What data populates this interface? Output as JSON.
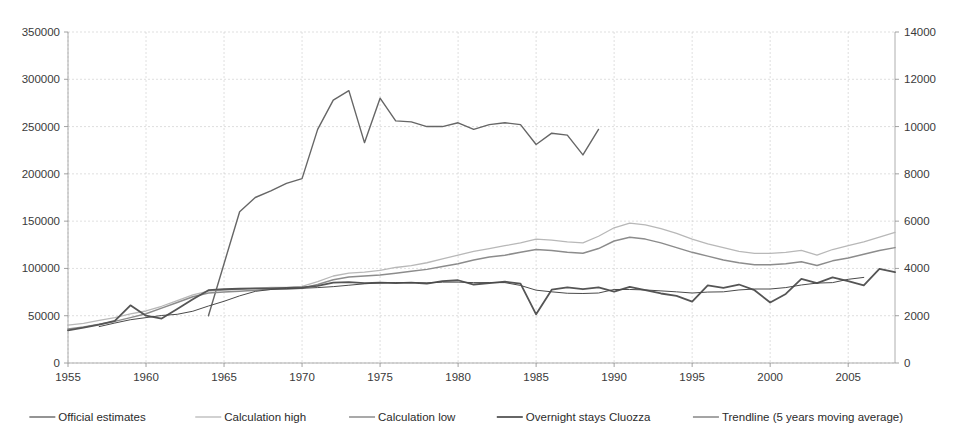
{
  "chart_data": {
    "type": "line",
    "title": "",
    "subtitle": "",
    "xlabel": "",
    "ylabel": "",
    "y2label": "",
    "grid": true,
    "legend_position": "bottom",
    "xlim": [
      1955,
      2008
    ],
    "xticks": [
      1955,
      1960,
      1965,
      1970,
      1975,
      1980,
      1985,
      1990,
      1995,
      2000,
      2005
    ],
    "xtick_labels": [
      "1955",
      "1960",
      "1965",
      "1970",
      "1975",
      "1980",
      "1985",
      "1990",
      "1995",
      "2000",
      "2005"
    ],
    "ylim": [
      0,
      350000
    ],
    "yticks": [
      0,
      50000,
      100000,
      150000,
      200000,
      250000,
      300000,
      350000
    ],
    "ytick_labels": [
      "0",
      "50000",
      "100000",
      "150000",
      "200000",
      "250000",
      "300000",
      "350000"
    ],
    "y2lim": [
      0,
      14000
    ],
    "y2ticks": [
      0,
      2000,
      4000,
      6000,
      8000,
      10000,
      12000,
      14000
    ],
    "y2tick_labels": [
      "0",
      "2000",
      "4000",
      "6000",
      "8000",
      "10000",
      "12000",
      "14000"
    ],
    "series": [
      {
        "name": "Official estimates",
        "axis": "left",
        "color": "#666666",
        "width": 1.4,
        "x": [
          1964,
          1965,
          1966,
          1967,
          1968,
          1969,
          1970,
          1971,
          1972,
          1973,
          1974,
          1975,
          1976,
          1977,
          1978,
          1979,
          1980,
          1981,
          1982,
          1983,
          1984,
          1985,
          1986,
          1987,
          1988,
          1989
        ],
        "values": [
          50000,
          105000,
          160000,
          175000,
          182000,
          190000,
          195000,
          247000,
          278000,
          288000,
          233000,
          280000,
          256000,
          255000,
          250000,
          250000,
          254000,
          247000,
          252000,
          254000,
          252000,
          231000,
          243000,
          241000,
          220000,
          247000
        ]
      },
      {
        "name": "Calculation high",
        "axis": "left",
        "color": "#b8b8b8",
        "width": 1.3,
        "x": [
          1955,
          1956,
          1957,
          1958,
          1959,
          1960,
          1961,
          1962,
          1963,
          1964,
          1965,
          1966,
          1967,
          1968,
          1969,
          1970,
          1971,
          1972,
          1973,
          1974,
          1975,
          1976,
          1977,
          1978,
          1979,
          1980,
          1981,
          1982,
          1983,
          1984,
          1985,
          1986,
          1987,
          1988,
          1989,
          1990,
          1991,
          1992,
          1993,
          1994,
          1995,
          1996,
          1997,
          1998,
          1999,
          2000,
          2001,
          2002,
          2003,
          2004,
          2005,
          2006,
          2007,
          2008
        ],
        "values": [
          40000,
          42000,
          45000,
          48000,
          52000,
          55000,
          60000,
          66000,
          72000,
          76000,
          77000,
          78000,
          79000,
          80000,
          80000,
          81000,
          86000,
          92000,
          95000,
          96000,
          98000,
          101000,
          103000,
          106000,
          110000,
          114000,
          118000,
          121000,
          124000,
          127000,
          131000,
          130000,
          128000,
          127000,
          134000,
          143000,
          148000,
          146000,
          142000,
          137000,
          131000,
          126000,
          122000,
          118000,
          116000,
          116000,
          117000,
          119000,
          114000,
          120000,
          124000,
          128000,
          133000,
          138000
        ]
      },
      {
        "name": "Calculation low",
        "axis": "left",
        "color": "#8c8c8c",
        "width": 1.5,
        "x": [
          1955,
          1956,
          1957,
          1958,
          1959,
          1960,
          1961,
          1962,
          1963,
          1964,
          1965,
          1966,
          1967,
          1968,
          1969,
          1970,
          1971,
          1972,
          1973,
          1974,
          1975,
          1976,
          1977,
          1978,
          1979,
          1980,
          1981,
          1982,
          1983,
          1984,
          1985,
          1986,
          1987,
          1988,
          1989,
          1990,
          1991,
          1992,
          1993,
          1994,
          1995,
          1996,
          1997,
          1998,
          1999,
          2000,
          2001,
          2002,
          2003,
          2004,
          2005,
          2006,
          2007,
          2008
        ],
        "values": [
          36000,
          38000,
          41000,
          44000,
          48000,
          52000,
          58000,
          64000,
          70000,
          74000,
          75000,
          76000,
          77000,
          78000,
          78000,
          79000,
          83000,
          88000,
          91000,
          92000,
          93000,
          95000,
          97000,
          99000,
          102000,
          105000,
          109000,
          112000,
          114000,
          117000,
          120000,
          119000,
          117000,
          116000,
          121000,
          129000,
          133000,
          131000,
          127000,
          122000,
          117000,
          113000,
          109000,
          106000,
          104000,
          104000,
          105000,
          107000,
          103000,
          108000,
          111000,
          115000,
          119000,
          122000
        ]
      },
      {
        "name": "Overnight stays Cluozza",
        "axis": "right",
        "color": "#555555",
        "width": 1.8,
        "x": [
          1955,
          1956,
          1957,
          1958,
          1959,
          1960,
          1961,
          1962,
          1963,
          1964,
          1965,
          1966,
          1967,
          1968,
          1969,
          1970,
          1971,
          1972,
          1973,
          1974,
          1975,
          1976,
          1977,
          1978,
          1979,
          1980,
          1981,
          1982,
          1983,
          1984,
          1985,
          1986,
          1987,
          1988,
          1989,
          1990,
          1991,
          1992,
          1993,
          1994,
          1995,
          1996,
          1997,
          1998,
          1999,
          2000,
          2001,
          2002,
          2003,
          2004,
          2005,
          2006,
          2007,
          2008
        ],
        "values": [
          1380,
          1500,
          1620,
          1780,
          2440,
          2000,
          1880,
          2280,
          2700,
          3080,
          3120,
          3140,
          3160,
          3160,
          3180,
          3200,
          3260,
          3400,
          3420,
          3380,
          3400,
          3380,
          3400,
          3360,
          3460,
          3500,
          3320,
          3380,
          3440,
          3360,
          2060,
          3100,
          3200,
          3120,
          3200,
          3020,
          3220,
          3080,
          2940,
          2840,
          2600,
          3280,
          3180,
          3320,
          3080,
          2560,
          2920,
          3560,
          3380,
          3620,
          3460,
          3280,
          3980,
          3840
        ]
      },
      {
        "name": "Trendline (5 years moving average)",
        "axis": "right",
        "color": "#4a4a4a",
        "width": 1.0,
        "x": [
          1957,
          1958,
          1959,
          1960,
          1961,
          1962,
          1963,
          1964,
          1965,
          1966,
          1967,
          1968,
          1969,
          1970,
          1971,
          1972,
          1973,
          1974,
          1975,
          1976,
          1977,
          1978,
          1979,
          1980,
          1981,
          1982,
          1983,
          1984,
          1985,
          1986,
          1987,
          1988,
          1989,
          1990,
          1991,
          1992,
          1993,
          1994,
          1995,
          1996,
          1997,
          1998,
          1999,
          2000,
          2001,
          2002,
          2003,
          2004,
          2005,
          2006
        ],
        "values": [
          1540,
          1690,
          1830,
          1920,
          2010,
          2060,
          2190,
          2410,
          2610,
          2840,
          3030,
          3110,
          3150,
          3160,
          3190,
          3230,
          3290,
          3350,
          3390,
          3400,
          3400,
          3390,
          3420,
          3420,
          3400,
          3400,
          3400,
          3280,
          3080,
          3010,
          2950,
          2940,
          2960,
          3110,
          3110,
          3090,
          3050,
          3010,
          2960,
          3000,
          3010,
          3090,
          3130,
          3130,
          3190,
          3300,
          3380,
          3400,
          3540,
          3620
        ]
      }
    ]
  },
  "legend": {
    "items": [
      {
        "label": "Official estimates",
        "color": "#666666",
        "width": 1.4
      },
      {
        "label": "Calculation high",
        "color": "#b8b8b8",
        "width": 1.3
      },
      {
        "label": "Calculation low",
        "color": "#8c8c8c",
        "width": 1.5
      },
      {
        "label": "Overnight stays Cluozza",
        "color": "#555555",
        "width": 1.8
      },
      {
        "label": "Trendline (5 years moving average)",
        "color": "#4a4a4a",
        "width": 1.0
      }
    ]
  },
  "plot_geometry": {
    "left": 68,
    "right": 895,
    "top": 32,
    "bottom": 363
  },
  "colors": {
    "background": "#ffffff",
    "grid": "#c9c9c9",
    "axis": "#9a9a9a",
    "text": "#2b2b2b"
  }
}
